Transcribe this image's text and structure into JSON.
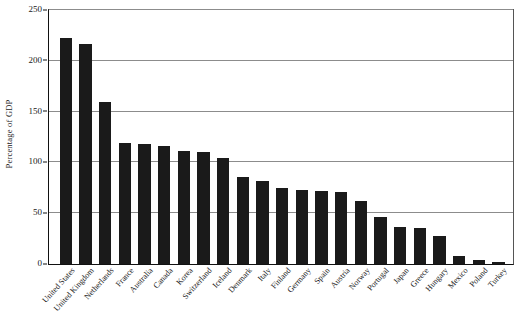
{
  "chart_data": {
    "type": "bar",
    "title": "",
    "subtitle": "",
    "xlabel": "",
    "ylabel": "Percentage of GDP",
    "ylim": [
      0,
      250
    ],
    "yticks": [
      0,
      50,
      100,
      150,
      200,
      250
    ],
    "ytick_labels": [
      "0",
      "50",
      "100",
      "150",
      "200",
      "250"
    ],
    "grid": true,
    "legend": null,
    "bar_color": "#1a1a1a",
    "axis_color": "#111111",
    "gridline_color": "#8c8c8c",
    "background_color": "#ffffff",
    "categories": [
      "United States",
      "United Kingdom",
      "Netherlands",
      "France",
      "Australia",
      "Canada",
      "Korea",
      "Switzerland",
      "Iceland",
      "Denmark",
      "Italy",
      "Finland",
      "Germany",
      "Spain",
      "Austria",
      "Norway",
      "Portugal",
      "Japan",
      "Greece",
      "Hungary",
      "Mexico",
      "Poland",
      "Turkey"
    ],
    "values": [
      222,
      217,
      159,
      119,
      118,
      116,
      111,
      110,
      104,
      86,
      82,
      75,
      73,
      72,
      71,
      62,
      46,
      36,
      35,
      28,
      8,
      4,
      2
    ]
  }
}
